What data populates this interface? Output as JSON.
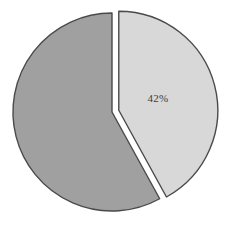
{
  "chart_data": {
    "type": "pie",
    "title": "",
    "subtitle": "",
    "xlabel": "",
    "ylabel": "",
    "grid": false,
    "legend": "none",
    "exploded": true,
    "categories": [
      "Segment A",
      "Segment B"
    ],
    "values": [
      42,
      58
    ],
    "labels": [
      "42%",
      ""
    ],
    "slices": [
      {
        "name": "Segment A",
        "value": 42,
        "label": "42%",
        "label_visible": true,
        "color": "#d8d8d8",
        "stroke": "#4a4a4a",
        "exploded": true,
        "start_angle_deg": 0,
        "end_angle_deg": 151.2
      },
      {
        "name": "Segment B",
        "value": 58,
        "label": "",
        "label_visible": false,
        "color": "#a0a0a0",
        "stroke": "#4a4a4a",
        "exploded": false,
        "start_angle_deg": 151.2,
        "end_angle_deg": 360
      }
    ],
    "total": 100,
    "units": "percent"
  },
  "colors": {
    "background": "#ffffff",
    "slice_light": "#d8d8d8",
    "slice_dark": "#a0a0a0",
    "outline": "#4a4a4a",
    "label_text": "#3a3a3a"
  },
  "geometry": {
    "center_x": 112,
    "center_y": 112,
    "radius": 99,
    "explode_offset": 7,
    "label_x": 158,
    "label_y": 99
  }
}
